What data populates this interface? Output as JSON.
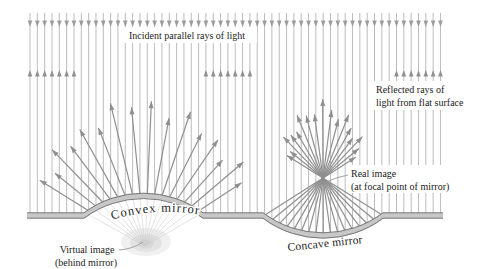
{
  "figure": {
    "labels": {
      "incident": "Incident parallel rays of light",
      "reflected_flat": [
        "Reflected rays of",
        "light from flat surface"
      ],
      "convex_mirror": "Convex mirror",
      "concave_mirror": "Concave mirror",
      "virtual_image": [
        "Virtual image",
        "(behind mirror)"
      ],
      "real_image": [
        "Real image",
        "(at focal point of mirror)"
      ]
    },
    "colors": {
      "background": "#ffffff",
      "incident_ray": "#ababab",
      "incident_arrowhead": "#9c9c9c",
      "reflected_ray": "#8f8f8f",
      "mirror_fill": "#c7c7c7",
      "mirror_edge": "#6b6b6b",
      "virtual_fan": "#d8d8d8",
      "glow": "#c9c9c9",
      "text": "#1b1b1b",
      "leader": "#9a9a9a"
    }
  }
}
